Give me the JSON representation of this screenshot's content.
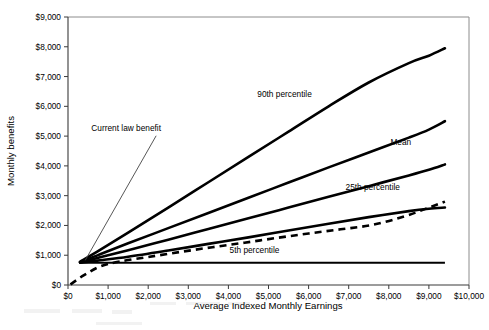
{
  "chart_data": {
    "type": "line",
    "title": "",
    "xlabel": "Average Indexed Monthly Earnings",
    "ylabel": "Monthly benefits",
    "xlim": [
      0,
      10000
    ],
    "ylim": [
      0,
      9000
    ],
    "xticks": [
      "$0",
      "$1,000",
      "$2,000",
      "$3,000",
      "$4,000",
      "$5,000",
      "$6,000",
      "$7,000",
      "$8,000",
      "$9,000",
      "$10,000"
    ],
    "xtick_values": [
      0,
      1000,
      2000,
      3000,
      4000,
      5000,
      6000,
      7000,
      8000,
      9000,
      10000
    ],
    "yticks": [
      "$0",
      "$1,000",
      "$2,000",
      "$3,000",
      "$4,000",
      "$5,000",
      "$6,000",
      "$7,000",
      "$8,000",
      "$9,000"
    ],
    "ytick_values": [
      0,
      1000,
      2000,
      3000,
      4000,
      5000,
      6000,
      7000,
      8000,
      9000
    ],
    "grid": false,
    "legend_position": "inline-annotations",
    "series": [
      {
        "name": "90th percentile",
        "style": "solid-thick",
        "label_text": "90th percentile",
        "x": [
          300,
          800,
          1500,
          2500,
          3500,
          4500,
          5500,
          6500,
          7500,
          8500,
          9000,
          9400
        ],
        "values": [
          780,
          1180,
          1760,
          2600,
          3450,
          4300,
          5150,
          6000,
          6800,
          7450,
          7700,
          7950
        ]
      },
      {
        "name": "Mean",
        "style": "solid-thick",
        "label_text": "Mean",
        "x": [
          300,
          800,
          1500,
          2500,
          3500,
          4500,
          5500,
          6500,
          7500,
          8500,
          9000,
          9400
        ],
        "values": [
          770,
          1030,
          1400,
          1910,
          2420,
          2930,
          3440,
          3950,
          4450,
          4950,
          5220,
          5500
        ]
      },
      {
        "name": "25th percentile",
        "style": "solid-thick",
        "label_text": "25th percentile",
        "x": [
          300,
          800,
          1500,
          2500,
          3500,
          4500,
          5500,
          6500,
          7500,
          8500,
          9000,
          9400
        ],
        "values": [
          760,
          930,
          1170,
          1520,
          1880,
          2240,
          2600,
          2960,
          3320,
          3680,
          3870,
          4050
        ]
      },
      {
        "name": "5th percentile",
        "style": "solid-thick",
        "label_text": "5th percentile",
        "x": [
          300,
          800,
          1500,
          2500,
          3500,
          4500,
          5500,
          6500,
          7500,
          8500,
          9000,
          9400
        ],
        "values": [
          750,
          830,
          950,
          1160,
          1380,
          1600,
          1830,
          2060,
          2280,
          2480,
          2560,
          2600
        ]
      },
      {
        "name": "Current law benefit",
        "style": "solid-flat",
        "label_text": "Current law benefit",
        "x": [
          300,
          9400
        ],
        "values": [
          750,
          750
        ]
      },
      {
        "name": "Dashed reference",
        "style": "dashed",
        "label_text": "",
        "x": [
          60,
          400,
          800,
          1300,
          2000,
          2800,
          3600,
          4400,
          5200,
          6000,
          6800,
          7600,
          8400,
          9000,
          9400
        ],
        "values": [
          20,
          330,
          620,
          790,
          940,
          1110,
          1270,
          1420,
          1580,
          1730,
          1870,
          2020,
          2310,
          2600,
          2800
        ]
      }
    ],
    "annotations": [
      {
        "text": "Current law benefit",
        "at_x": 1450,
        "at_y": 5180,
        "points_to_x": 430,
        "points_to_y": 830
      },
      {
        "text": "90th percentile",
        "at_x": 5400,
        "at_y": 6300
      },
      {
        "text": "Mean",
        "at_x": 8300,
        "at_y": 4700
      },
      {
        "text": "25th percentile",
        "at_x": 7600,
        "at_y": 3180
      },
      {
        "text": "5th percentile",
        "at_x": 4650,
        "at_y": 1070
      }
    ]
  }
}
